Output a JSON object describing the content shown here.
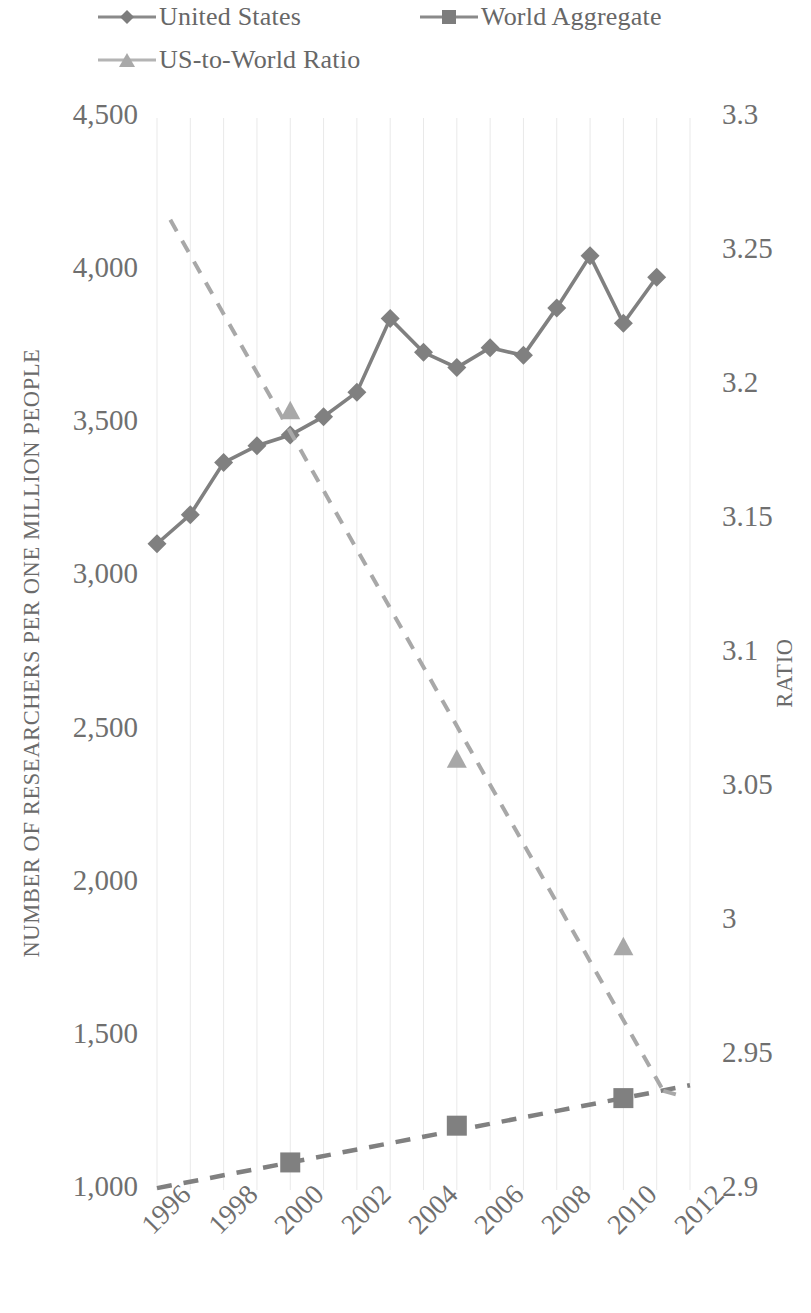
{
  "legend": {
    "items": [
      {
        "label": "United States",
        "marker": "diamond-marker-icon",
        "dash": false,
        "color": "#808080"
      },
      {
        "label": "World Aggregate",
        "marker": "square-marker-icon",
        "dash": true,
        "color": "#808080"
      },
      {
        "label": "US-to-World Ratio",
        "marker": "triangle-marker-icon",
        "dash": true,
        "color": "#a8a8a8"
      }
    ]
  },
  "axes": {
    "left_title": "NUMBER OF RESEARCHERS PER ONE MILLION PEOPLE",
    "right_title": "RATIO",
    "left_ticks": [
      "4,500",
      "4,000",
      "3,500",
      "3,000",
      "2,500",
      "2,000",
      "1,500",
      "1,000"
    ],
    "right_ticks": [
      "3.3",
      "3.25",
      "3.2",
      "3.15",
      "3.1",
      "3.05",
      "3",
      "2.95",
      "2.9"
    ],
    "x_ticks": [
      "1996",
      "1998",
      "2000",
      "2002",
      "2004",
      "2006",
      "2008",
      "2010",
      "2012"
    ]
  },
  "chart_data": {
    "type": "line",
    "title": "",
    "xlabel": "",
    "ylabel": "NUMBER OF RESEARCHERS PER ONE MILLION PEOPLE",
    "y2label": "RATIO",
    "xlim": [
      1996,
      2012
    ],
    "ylim": [
      1000,
      4500
    ],
    "y2lim": [
      2.9,
      3.3
    ],
    "grid": "vertical-only",
    "legend_position": "top",
    "x": [
      1996,
      1997,
      1998,
      1999,
      2000,
      2001,
      2002,
      2003,
      2004,
      2005,
      2006,
      2007,
      2008,
      2009,
      2010,
      2011,
      2012
    ],
    "series": [
      {
        "name": "United States",
        "axis": "left",
        "marker": "diamond",
        "linestyle": "solid",
        "color": "#808080",
        "x": [
          1996,
          1997,
          1998,
          1999,
          2000,
          2001,
          2002,
          2003,
          2004,
          2005,
          2006,
          2007,
          2008,
          2009,
          2010,
          2011
        ],
        "values": [
          3110,
          3205,
          3375,
          3430,
          3465,
          3525,
          3605,
          3845,
          3735,
          3685,
          3750,
          3725,
          3880,
          4050,
          3830,
          3980
        ]
      },
      {
        "name": "World Aggregate",
        "axis": "left",
        "marker": "square",
        "linestyle": "dashed",
        "color": "#808080",
        "x": [
          2000,
          2005,
          2010
        ],
        "values": [
          1090,
          1210,
          1300
        ]
      },
      {
        "name": "US-to-World Ratio",
        "axis": "right",
        "marker": "triangle",
        "linestyle": "dashed",
        "color": "#a8a8a8",
        "x": [
          2000,
          2005,
          2010
        ],
        "values": [
          3.19,
          3.06,
          2.99
        ],
        "trend_x": [
          1996.4,
          2011.2
        ],
        "trend_values": [
          3.262,
          2.937
        ]
      }
    ]
  }
}
